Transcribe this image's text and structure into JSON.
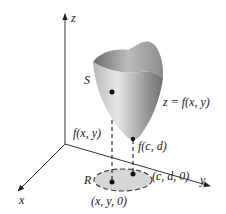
{
  "figure": {
    "type": "3d-surface-diagram",
    "axes": {
      "x_label": "x",
      "y_label": "y",
      "z_label": "z"
    },
    "surface": {
      "name": "S",
      "equation": "z = f(x, y)"
    },
    "region": {
      "name": "R"
    },
    "points": {
      "surface_point_label": "f(x, y)",
      "minimum_label": "f(c, d)",
      "domain_point_label": "(x, y, 0)",
      "minimum_domain_label": "(c, d, 0)"
    },
    "colors": {
      "axis": "#333333",
      "surface_light": "#d9d9d9",
      "surface_dark": "#7a7a7a",
      "region_fill": "#d6d6d6",
      "dashes": "#222222"
    }
  }
}
